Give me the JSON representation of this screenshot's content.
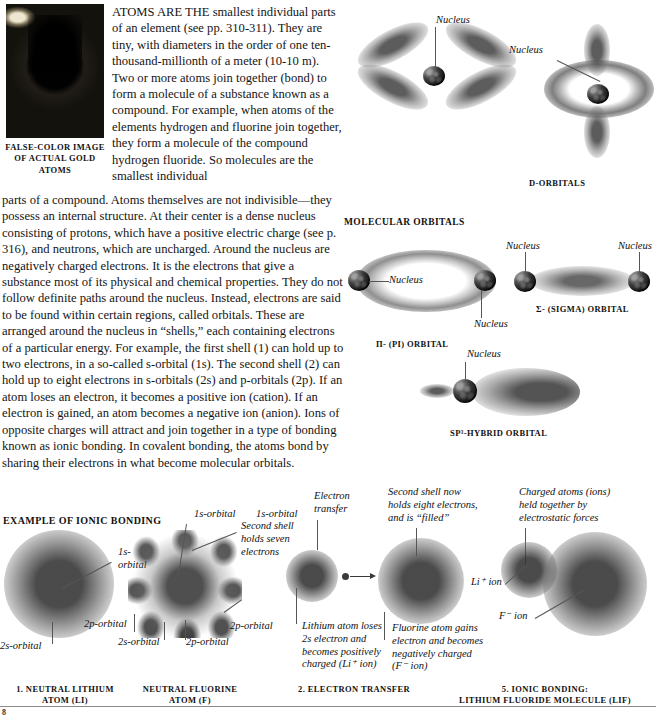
{
  "photo": {
    "caption_line1": "FALSE-COLOR IMAGE",
    "caption_line2": "OF ACTUAL GOLD",
    "caption_line3": "ATOMS",
    "alt": "false-color-gold-atoms-micrograph"
  },
  "body": {
    "paragraph_part1": "ATOMS ARE THE smallest individual parts of an element (see pp. 310-311). They are tiny, with diameters in the order of one ten-thousand-millionth of a meter (10-10 m). Two or more atoms join together (bond) to form a molecule of a substance known as a compound. For example, when atoms of the elements hydrogen and fluorine join together, they form a molecule of the compound hydrogen fluoride. So molecules are the smallest individual",
    "paragraph_part2": "parts of a compound. Atoms themselves are not indivisible—they possess an internal structure. At their center is a dense nucleus consisting of protons, which have a positive electric charge (see p. 316), and neutrons, which are uncharged. Around the nucleus are negatively charged electrons. It is the electrons that give a substance most of its physical and chemical properties. They do not follow definite paths around the nucleus. Instead, electrons are said to be found within certain regions, called orbitals. These are arranged around the nucleus in “shells,” each containing electrons of a particular energy. For example, the first shell (1) can hold up to two electrons, in a so-called s-orbital (1s). The second shell (2) can hold up to eight electrons in s-orbitals (2s) and p-orbitals (2p). If an atom loses an electron, it becomes a positive ion (cation). If an electron is gained, an atom becomes a negative ion (anion). Ions of opposite charges will attract and join together in a type of bonding known as ionic bonding. In covalent bonding, the atoms bond by sharing their electrons in what become molecular orbitals."
  },
  "d_orbitals": {
    "section_label": "D-ORBITALS",
    "cloverleaf_nucleus_label": "Nucleus",
    "ring_nucleus_label": "Nucleus"
  },
  "molecular_orbitals": {
    "section_label": "MOLECULAR ORBITALS",
    "pi": {
      "label": "π- (PI) ORBITAL",
      "nucleus_left_label": "Nucleus",
      "nucleus_right_label": "Nucleus"
    },
    "sigma": {
      "label": "Σ- (SIGMA) ORBITAL",
      "nucleus_left_label": "Nucleus",
      "nucleus_right_label": "Nucleus"
    },
    "sp3": {
      "label": "SP³-HYBRID ORBITAL",
      "nucleus_label": "Nucleus"
    }
  },
  "ionic_bonding": {
    "section_label": "EXAMPLE OF IONIC BONDING",
    "steps": [
      {
        "number": "1.",
        "caption_line1": "1. NEUTRAL LITHIUM",
        "caption_line2": "ATOM (Li)"
      },
      {
        "caption_line1": "NEUTRAL FLUORINE",
        "caption_line2": "ATOM (F)"
      },
      {
        "caption_line1": "2. ELECTRON TRANSFER",
        "caption_line2": ""
      },
      {
        "caption_line1": "5. IONIC BONDING:",
        "caption_line2": "LITHIUM FLUORIDE MOLECULE (LiF)"
      }
    ],
    "annotations": {
      "lithium_1s": "1s-orbital",
      "lithium_2s": "2s-orbital",
      "fluorine_1s_left": "1s-orbital",
      "fluorine_1s_right": "1s-orbital",
      "fluorine_second_shell": "Second shell holds seven electrons",
      "fluorine_2p_left": "2p-orbital",
      "fluorine_2s": "2s-orbital",
      "fluorine_2p_mid": "2p-orbital",
      "fluorine_2p_right": "2p-orbital",
      "electron_transfer": "Electron transfer",
      "second_shell_filled": "Second shell now holds eight electrons, and is “filled”",
      "charged_atoms": "Charged atoms (ions) held together by electrostatic forces",
      "lithium_atom_note": "Lithium atom loses 2s electron and becomes positively charged (Li⁺ ion)",
      "fluorine_atom_note": "Fluorine atom gains electron and becomes negatively charged (F⁻ ion)",
      "li_ion": "Li⁺ ion",
      "f_ion": "F⁻ ion"
    }
  },
  "footer": {
    "page_number": "8"
  },
  "colors": {
    "ink": "#151515",
    "rule": "#8a8a8a",
    "leader": "#555555",
    "cloud": "#6e6e6e"
  }
}
